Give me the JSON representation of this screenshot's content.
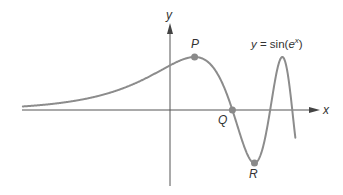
{
  "chart_data": {
    "type": "line",
    "title": "",
    "function_label": "y = sin(e^x)",
    "function_label_parts": {
      "lhs": "y",
      "eq": " = sin(",
      "base": "e",
      "exp": "x",
      "close": ")"
    },
    "xlabel": "x",
    "ylabel": "y",
    "grid": false,
    "legend": "none",
    "xlim": [
      -2.7,
      2.45
    ],
    "ylim": [
      -1.4,
      1.6
    ],
    "series": [
      {
        "name": "y = sin(e^x)",
        "color": "#8c8c8c",
        "x": [
          -2.7,
          -2.0,
          -1.5,
          -1.0,
          -0.5,
          0.0,
          0.4516,
          0.8,
          1.1447,
          1.3,
          1.5499,
          1.8,
          1.9,
          2.0,
          2.1,
          2.2,
          2.3,
          2.35
        ],
        "y": [
          0.067,
          0.135,
          0.221,
          0.36,
          0.569,
          0.841,
          1.0,
          0.81,
          0.0,
          -0.937,
          -1.0,
          0.346,
          0.999,
          0.894,
          -0.856,
          -0.27,
          0.959,
          -0.4
        ]
      }
    ],
    "points": [
      {
        "label": "P",
        "x": 0.4516,
        "y": 1.0,
        "description": "local maximum"
      },
      {
        "label": "Q",
        "x": 1.1447,
        "y": 0.0,
        "description": "x-intercept"
      },
      {
        "label": "R",
        "x": 1.5499,
        "y": -1.0,
        "description": "local minimum"
      }
    ]
  },
  "colors": {
    "curve": "#8c8c8c",
    "points": "#8a8a8a",
    "axes": "#555555",
    "text": "#333333"
  }
}
